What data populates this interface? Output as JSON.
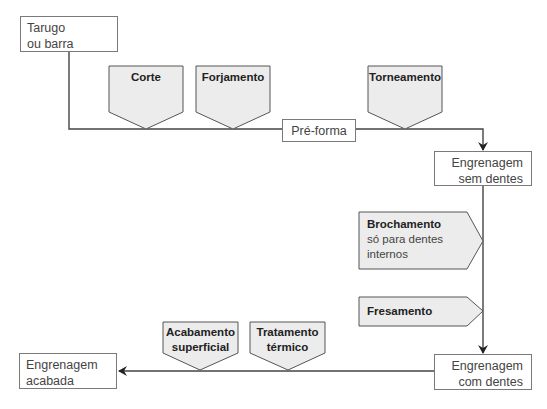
{
  "diagram": {
    "nodes": {
      "start": {
        "line1": "Tarugo",
        "line2": "ou barra"
      },
      "preform": {
        "label": "Pré-forma"
      },
      "blank": {
        "line1": "Engrenagem",
        "line2": "sem dentes"
      },
      "toothed": {
        "line1": "Engrenagem",
        "line2": "com dentes"
      },
      "finished": {
        "line1": "Engrenagem",
        "line2": "acabada"
      }
    },
    "processes": {
      "corte": {
        "label": "Corte"
      },
      "forjamento": {
        "label": "Forjamento"
      },
      "torneamento": {
        "label": "Torneamento"
      },
      "brochamento": {
        "label": "Brochamento",
        "note_line1": "só para dentes",
        "note_line2": "internos"
      },
      "fresamento": {
        "label": "Fresamento"
      },
      "acabamento": {
        "line1": "Acabamento",
        "line2": "superficial"
      },
      "tratamento": {
        "line1": "Tratamento",
        "line2": "térmico"
      }
    },
    "colors": {
      "process_fill": "#ececec",
      "stroke": "#444444",
      "box_border": "#7a7a7a"
    }
  }
}
